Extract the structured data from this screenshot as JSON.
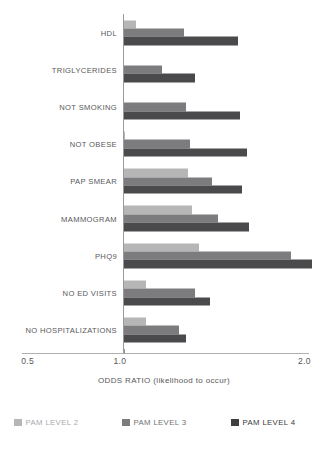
{
  "chart_data": {
    "type": "bar",
    "orientation": "horizontal",
    "title": "",
    "xlabel": "ODDS RATIO (likelihood to occur)",
    "ylabel": "",
    "xlim": [
      0.5,
      2.1
    ],
    "baseline": 1.0,
    "grid": false,
    "legend_position": "bottom",
    "xticks": [
      0.5,
      1.0,
      2.0
    ],
    "xtick_labels": [
      "0.5",
      "1.0",
      "2.0"
    ],
    "categories": [
      "HDL",
      "TRIGLYCERIDES",
      "NOT SMOKING",
      "NOT OBESE",
      "PAP SMEAR",
      "MAMMOGRAM",
      "PHQ9",
      "NO ED VISITS",
      "NO HOSPITALIZATIONS"
    ],
    "series": [
      {
        "name": "PAM LEVEL 2",
        "color": "#b6b6b6",
        "values": [
          1.07,
          1.0,
          1.0,
          1.01,
          1.35,
          1.37,
          1.41,
          1.12,
          1.12
        ]
      },
      {
        "name": "PAM LEVEL 3",
        "color": "#7c7c7e",
        "values": [
          1.33,
          1.21,
          1.34,
          1.36,
          1.48,
          1.51,
          1.91,
          1.39,
          1.3
        ]
      },
      {
        "name": "PAM LEVEL 4",
        "color": "#4a4a4c",
        "values": [
          1.62,
          1.39,
          1.63,
          1.67,
          1.64,
          1.68,
          2.02,
          1.47,
          1.34
        ]
      }
    ]
  },
  "axis": {
    "title": "ODDS RATIO (likelihood to occur)",
    "ticks": [
      {
        "label": "0.5",
        "value": 0.5
      },
      {
        "label": "1.0",
        "value": 1.0
      },
      {
        "label": "2.0",
        "value": 2.0
      }
    ]
  },
  "legend": {
    "items": [
      {
        "label": "PAM LEVEL 2",
        "color": "#b6b6b6"
      },
      {
        "label": "PAM LEVEL 3",
        "color": "#7c7c7e"
      },
      {
        "label": "PAM LEVEL 4",
        "color": "#3f3f41"
      }
    ]
  }
}
